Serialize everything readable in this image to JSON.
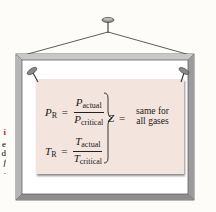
{
  "figure": {
    "colors": {
      "background": "#fdfcf8",
      "frame_outer": "#9a9a9a",
      "frame_inner": "#cfcfcf",
      "paper": "#f3e5de",
      "text": "#1a1a1a",
      "caption_accent": "#d4202a"
    },
    "side_text_fragments": {
      "red": "i",
      "lines": [
        "e",
        "d",
        "f",
        "."
      ]
    },
    "formulas": {
      "reduced_pressure": {
        "lhs": "P",
        "lhs_sub": "R",
        "equals": "=",
        "numerator": "P",
        "numerator_sub": "actual",
        "denominator": "P",
        "denominator_sub": "critical"
      },
      "reduced_temperature": {
        "lhs": "T",
        "lhs_sub": "R",
        "equals": "=",
        "numerator": "T",
        "numerator_sub": "actual",
        "denominator": "T",
        "denominator_sub": "critical"
      },
      "result": {
        "symbol": "Z",
        "equals": "=",
        "line1": "same for",
        "line2": "all gases"
      }
    }
  }
}
